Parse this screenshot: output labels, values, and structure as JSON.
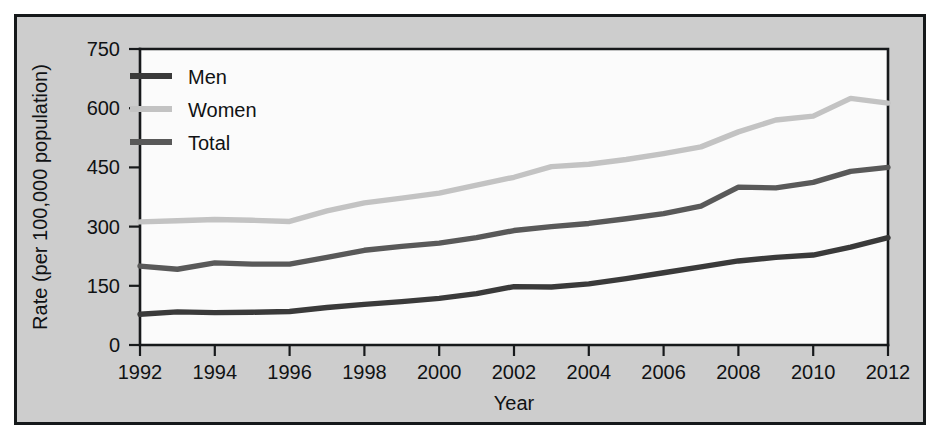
{
  "figure": {
    "background_color": "#cdcdcd",
    "plot_background_color": "#fbfbfb",
    "frame_color": "#15181a"
  },
  "chart_data": {
    "type": "line",
    "title": "",
    "xlabel": "Year",
    "ylabel": "Rate (per 100,000 population)",
    "xlim": [
      1992,
      2012
    ],
    "ylim": [
      0,
      750
    ],
    "yticks": [
      0,
      150,
      300,
      450,
      600,
      750
    ],
    "ytick_labels": [
      "0",
      "150",
      "300",
      "450",
      "600",
      "750"
    ],
    "xticks": [
      1992,
      1994,
      1996,
      1998,
      2000,
      2002,
      2004,
      2006,
      2008,
      2010,
      2012
    ],
    "xtick_labels": [
      "1992",
      "1994",
      "1996",
      "1998",
      "2000",
      "2002",
      "2004",
      "2006",
      "2008",
      "2010",
      "2012"
    ],
    "grid": false,
    "legend_position": "upper left",
    "x": [
      1992,
      1993,
      1994,
      1995,
      1996,
      1997,
      1998,
      1999,
      2000,
      2001,
      2002,
      2003,
      2004,
      2005,
      2006,
      2007,
      2008,
      2009,
      2010,
      2011,
      2012
    ],
    "series": [
      {
        "name": "Men",
        "color": "#3a3a3a",
        "values": [
          78,
          84,
          82,
          83,
          85,
          95,
          103,
          110,
          118,
          130,
          148,
          147,
          155,
          168,
          183,
          198,
          213,
          222,
          228,
          248,
          272
        ]
      },
      {
        "name": "Women",
        "color": "#c3c3c3",
        "values": [
          312,
          315,
          318,
          316,
          313,
          340,
          360,
          372,
          385,
          405,
          425,
          452,
          458,
          470,
          485,
          502,
          540,
          570,
          580,
          625,
          613
        ]
      },
      {
        "name": "Total",
        "color": "#595959",
        "values": [
          200,
          192,
          208,
          205,
          205,
          222,
          240,
          250,
          258,
          272,
          290,
          300,
          308,
          320,
          333,
          352,
          400,
          398,
          412,
          440,
          450
        ]
      }
    ]
  },
  "legend": {
    "items": [
      {
        "label": "Men",
        "color": "#3a3a3a"
      },
      {
        "label": "Women",
        "color": "#c3c3c3"
      },
      {
        "label": "Total",
        "color": "#595959"
      }
    ]
  }
}
